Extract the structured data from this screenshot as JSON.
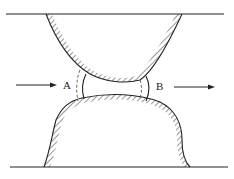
{
  "diagram": {
    "labels": {
      "a": "A",
      "b": "B"
    },
    "colors": {
      "stroke": "#222222",
      "background": "#ffffff"
    },
    "elements": [
      "top-boundary-line",
      "bottom-boundary-line",
      "upper-grain",
      "lower-grain",
      "pore-throat",
      "inflow-arrow",
      "outflow-arrow",
      "interface-a",
      "interface-b"
    ]
  }
}
